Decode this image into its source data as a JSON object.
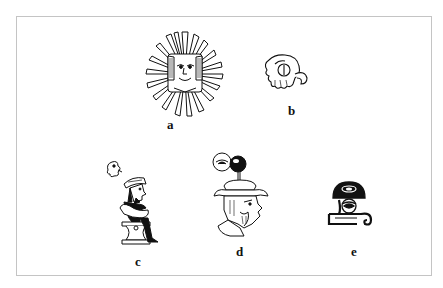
{
  "figure": {
    "panels": [
      {
        "id": "a",
        "label": "a",
        "description": "sun glyph with human face and radiating rays"
      },
      {
        "id": "b",
        "label": "b",
        "description": "curled hand/shell glyph"
      },
      {
        "id": "c",
        "label": "c",
        "description": "seated figure with hat on chair, small bird glyph above"
      },
      {
        "id": "d",
        "label": "d",
        "description": "bearded head with brimmed hat and eye-like glyph on stem"
      },
      {
        "id": "e",
        "label": "e",
        "description": "domed black cap glyph over eye and scroll base"
      }
    ]
  },
  "colors": {
    "ink": "#111111",
    "frame": "#c4c4c4",
    "background": "#ffffff"
  }
}
